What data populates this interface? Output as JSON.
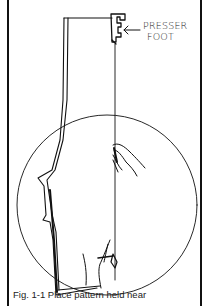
{
  "figure": {
    "callout_label_line1": "PRESSER",
    "callout_label_line2": "FOOT",
    "callout_arrow": "←",
    "caption": "Fig. 1-1 Place pattern held near",
    "elements": [
      "presser-foot",
      "fabric-piece",
      "circle-background",
      "right-hand",
      "left-hand",
      "seam-line"
    ],
    "colors": {
      "ink": "#111111",
      "background": "#ffffff"
    }
  }
}
